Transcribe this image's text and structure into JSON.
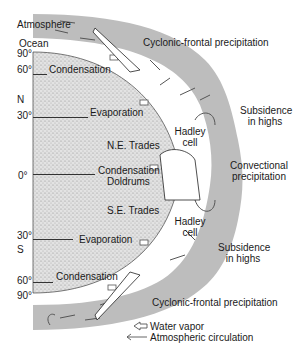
{
  "diagram": {
    "layers": {
      "atmosphere": "Atmosphere",
      "ocean": "Ocean"
    },
    "latitudes": [
      {
        "label": "90°",
        "y": 52
      },
      {
        "label": "60°",
        "y": 68
      },
      {
        "label": "N",
        "y": 98
      },
      {
        "label": "30°",
        "y": 113
      },
      {
        "label": "0°",
        "y": 174
      },
      {
        "label": "30°",
        "y": 234
      },
      {
        "label": "S",
        "y": 247
      },
      {
        "label": "60°",
        "y": 276
      },
      {
        "label": "90°",
        "y": 292
      }
    ],
    "surface_processes": {
      "condensation_north": "Condensation",
      "evaporation_north": "Evaporation",
      "ne_trades": "N.E. Trades",
      "condensation_equator": "Condensation",
      "doldrums": "Doldrums",
      "se_trades": "S.E. Trades",
      "evaporation_south": "Evaporation",
      "condensation_south": "Condensation"
    },
    "atmospheric_features": {
      "cyclonic_north": "Cyclonic-frontal precipitation",
      "subsidence_north_1": "Subsidence",
      "subsidence_north_2": "in highs",
      "hadley_north_1": "Hadley",
      "hadley_north_2": "cell",
      "convectional_1": "Convectional",
      "convectional_2": "precipitation",
      "hadley_south_1": "Hadley",
      "hadley_south_2": "cell",
      "subsidence_south_1": "Subsidence",
      "subsidence_south_2": "in highs",
      "cyclonic_south": "Cyclonic-frontal precipitation"
    },
    "legend": {
      "water_vapor": "Water vapor",
      "atmospheric_circulation": "Atmospheric circulation"
    },
    "colors": {
      "atmosphere_band": "#bdbdbd",
      "ocean_fill": "#d9d9d9",
      "text": "#1a1a1a",
      "arrows": "#555555"
    }
  }
}
